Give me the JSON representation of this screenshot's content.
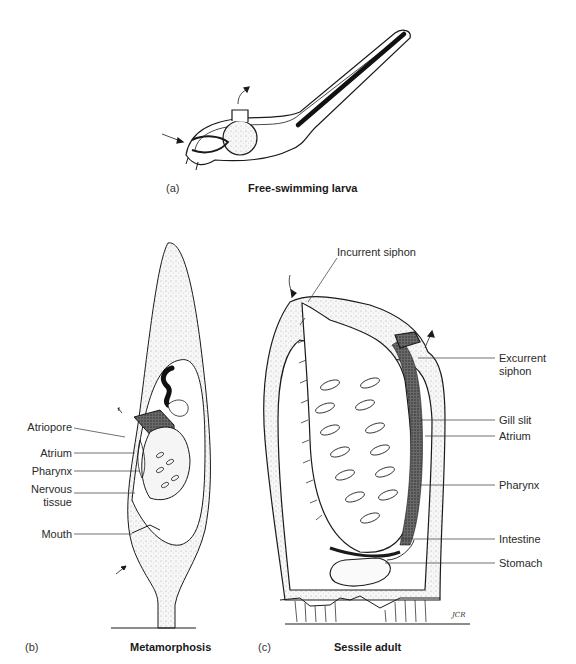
{
  "figure": {
    "panels": [
      {
        "letter": "(a)",
        "caption": "Free-swimming larva"
      },
      {
        "letter": "(b)",
        "caption": "Metamorphosis"
      },
      {
        "letter": "(c)",
        "caption": "Sessile adult"
      }
    ],
    "metamorphosis_labels": [
      "Atriopore",
      "Atrium",
      "Pharynx",
      "Nervous",
      "tissue",
      "Mouth"
    ],
    "adult_labels": {
      "top": "Incurrent siphon",
      "right": [
        "Excurrent",
        "siphon",
        "Gill slit",
        "Atrium",
        "Pharynx",
        "Intestine",
        "Stomach"
      ]
    },
    "signature": "JCR"
  },
  "colors": {
    "ink": "#1a1a1a",
    "stipple": "#cfcfcf",
    "background": "#ffffff"
  }
}
